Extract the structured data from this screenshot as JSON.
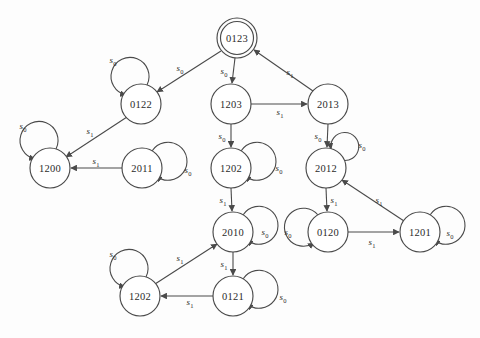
{
  "diagram": {
    "type": "state-transition-diagram",
    "title": "",
    "alphabet": [
      "s0",
      "s1"
    ],
    "start_state": "0123",
    "accepting_states": [
      "0123"
    ],
    "colors": {
      "background": "#fdfdfd",
      "stroke": "#4a4a4a",
      "node_fill": "#ffffff",
      "text": "#2b2b2b"
    },
    "label_symbols": {
      "s0": {
        "base": "s",
        "sub": "0"
      },
      "s1": {
        "base": "s",
        "sub": "1"
      }
    },
    "nodes": [
      {
        "id": "n0123",
        "label": "0123",
        "cx": 237,
        "cy": 38,
        "r": 20,
        "double": true
      },
      {
        "id": "n0122",
        "label": "0122",
        "cx": 141,
        "cy": 104,
        "r": 20,
        "double": false
      },
      {
        "id": "n1203",
        "label": "1203",
        "cx": 231,
        "cy": 104,
        "r": 20,
        "double": false
      },
      {
        "id": "n2013",
        "label": "2013",
        "cx": 328,
        "cy": 104,
        "r": 20,
        "double": false
      },
      {
        "id": "n1200",
        "label": "1200",
        "cx": 50,
        "cy": 168,
        "r": 20,
        "double": false
      },
      {
        "id": "n2011",
        "label": "2011",
        "cx": 142,
        "cy": 168,
        "r": 20,
        "double": false
      },
      {
        "id": "n1202m",
        "label": "1202",
        "cx": 231,
        "cy": 168,
        "r": 20,
        "double": false
      },
      {
        "id": "n2012",
        "label": "2012",
        "cx": 326,
        "cy": 168,
        "r": 20,
        "double": false
      },
      {
        "id": "n2010",
        "label": "2010",
        "cx": 233,
        "cy": 232,
        "r": 20,
        "double": false
      },
      {
        "id": "n0120",
        "label": "0120",
        "cx": 328,
        "cy": 232,
        "r": 20,
        "double": false
      },
      {
        "id": "n1201",
        "label": "1201",
        "cx": 420,
        "cy": 232,
        "r": 20,
        "double": false
      },
      {
        "id": "n1202b",
        "label": "1202",
        "cx": 140,
        "cy": 296,
        "r": 20,
        "double": false
      },
      {
        "id": "n0121",
        "label": "0121",
        "cx": 233,
        "cy": 296,
        "r": 20,
        "double": false
      }
    ],
    "edges": [
      {
        "from": "0123",
        "to": "0122",
        "symbol": "s0",
        "lx": 180,
        "ly": 68
      },
      {
        "from": "0123",
        "to": "1203",
        "symbol": "s0",
        "lx": 224,
        "ly": 71
      },
      {
        "from": "2013",
        "to": "0123",
        "symbol": "s1",
        "lx": 290,
        "ly": 72
      },
      {
        "from": "1203",
        "to": "2013",
        "symbol": "s1",
        "lx": 280,
        "ly": 112
      },
      {
        "from": "0122",
        "to": "1200",
        "symbol": "s1",
        "lx": 90,
        "ly": 131
      },
      {
        "from": "2011",
        "to": "1200",
        "symbol": "s1",
        "lx": 96,
        "ly": 161
      },
      {
        "from": "1203",
        "to": "1202",
        "symbol": "s0",
        "lx": 222,
        "ly": 136
      },
      {
        "from": "2013",
        "to": "2012",
        "symbol": "s0",
        "lx": 318,
        "ly": 136
      },
      {
        "from": "1202",
        "to": "2010",
        "symbol": "s1",
        "lx": 223,
        "ly": 200
      },
      {
        "from": "2012",
        "to": "0120",
        "symbol": "s1",
        "lx": 334,
        "ly": 200
      },
      {
        "from": "1201",
        "to": "2012",
        "symbol": "s1",
        "lx": 379,
        "ly": 200
      },
      {
        "from": "0120",
        "to": "1201",
        "symbol": "s1",
        "lx": 372,
        "ly": 242
      },
      {
        "from": "2010",
        "to": "0121",
        "symbol": "s1",
        "lx": 224,
        "ly": 264
      },
      {
        "from": "1202b",
        "to": "2010",
        "symbol": "s1",
        "lx": 180,
        "ly": 258
      },
      {
        "from": "0121",
        "to": "1202b",
        "symbol": "s1",
        "lx": 190,
        "ly": 302
      }
    ],
    "self_loops": [
      {
        "node": "0122",
        "symbol": "s0",
        "lx": 113,
        "ly": 60
      },
      {
        "node": "1200",
        "symbol": "s0",
        "lx": 23,
        "ly": 126
      },
      {
        "node": "2011",
        "symbol": "s0",
        "lx": 188,
        "ly": 170
      },
      {
        "node": "1202m",
        "symbol": "s0",
        "lx": 279,
        "ly": 168
      },
      {
        "node": "2012",
        "symbol": "s0",
        "lx": 362,
        "ly": 145
      },
      {
        "node": "2010",
        "symbol": "s0",
        "lx": 265,
        "ly": 232
      },
      {
        "node": "0120",
        "symbol": "s0",
        "lx": 288,
        "ly": 232
      },
      {
        "node": "1201",
        "symbol": "s0",
        "lx": 450,
        "ly": 233
      },
      {
        "node": "1202b",
        "symbol": "s0",
        "lx": 113,
        "ly": 254
      },
      {
        "node": "0121",
        "symbol": "s0",
        "lx": 283,
        "ly": 297
      }
    ]
  }
}
